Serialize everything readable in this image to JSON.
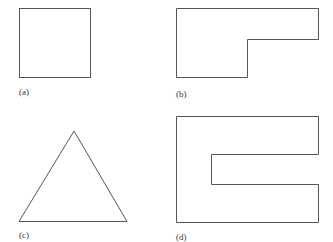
{
  "figure": {
    "panels": [
      {
        "id": "a",
        "label": "(a)",
        "shape": "square"
      },
      {
        "id": "b",
        "label": "(b)",
        "shape": "l-shape"
      },
      {
        "id": "c",
        "label": "(c)",
        "shape": "triangle"
      },
      {
        "id": "d",
        "label": "(d)",
        "shape": "c-shape"
      }
    ],
    "colors": {
      "stroke": "#555555",
      "background": "#ffffff"
    }
  }
}
